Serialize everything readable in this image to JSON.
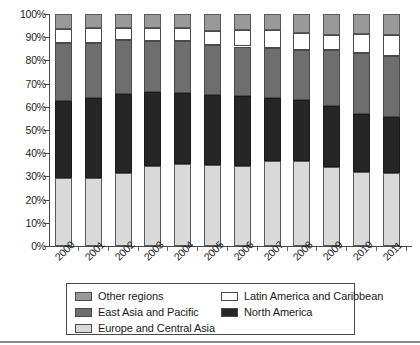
{
  "chart_data": {
    "type": "bar",
    "subtype": "stacked-100-percent",
    "title": "",
    "subtitle": "",
    "xlabel": "",
    "ylabel": "",
    "ylim": [
      0,
      100
    ],
    "yticks": [
      "0%",
      "10%",
      "20%",
      "30%",
      "40%",
      "50%",
      "60%",
      "70%",
      "80%",
      "90%",
      "100%"
    ],
    "ytick_values": [
      0,
      10,
      20,
      30,
      40,
      50,
      60,
      70,
      80,
      90,
      100
    ],
    "grid": false,
    "legend_position": "bottom",
    "categories": [
      "2000",
      "2001",
      "2002",
      "2003",
      "2004",
      "2005",
      "2006",
      "2007",
      "2008",
      "2009",
      "2010",
      "2011"
    ],
    "stack_order_bottom_to_top": [
      "Europe and Central Asia",
      "North America",
      "East Asia and Pacific",
      "Latin America and Caribbean",
      "Other regions"
    ],
    "series": [
      {
        "name": "Europe and Central Asia",
        "color": "#d9d9d9",
        "values": [
          29.5,
          29.5,
          31.5,
          34.5,
          35.5,
          35.0,
          34.5,
          36.5,
          36.5,
          34.0,
          32.0,
          31.5
        ]
      },
      {
        "name": "North America",
        "color": "#262626",
        "values": [
          33.0,
          34.5,
          34.0,
          32.0,
          30.5,
          30.0,
          30.0,
          27.5,
          26.5,
          26.5,
          25.0,
          24.0
        ]
      },
      {
        "name": "East Asia and Pacific",
        "color": "#6e6e6e",
        "values": [
          25.0,
          23.5,
          23.5,
          22.0,
          22.5,
          21.5,
          21.5,
          21.5,
          21.5,
          24.0,
          26.0,
          26.5
        ]
      },
      {
        "name": "Latin America and Caribbean",
        "color": "#ffffff",
        "values": [
          6.0,
          6.5,
          5.0,
          5.5,
          5.5,
          6.0,
          7.0,
          7.5,
          7.5,
          6.5,
          8.5,
          9.0
        ]
      },
      {
        "name": "Other regions",
        "color": "#999999",
        "values": [
          6.5,
          6.0,
          6.0,
          6.0,
          6.0,
          7.5,
          7.0,
          7.0,
          8.0,
          9.0,
          8.5,
          9.0
        ]
      }
    ],
    "cumulative_tops": [
      [
        29.5,
        62.5,
        87.5,
        93.5,
        100
      ],
      [
        29.5,
        64.0,
        87.5,
        94.0,
        100
      ],
      [
        31.5,
        65.5,
        89.0,
        94.0,
        100
      ],
      [
        34.5,
        66.5,
        88.5,
        94.0,
        100
      ],
      [
        35.5,
        66.0,
        88.5,
        94.0,
        100
      ],
      [
        35.0,
        65.0,
        86.5,
        92.5,
        100
      ],
      [
        34.5,
        64.5,
        86.0,
        93.0,
        100
      ],
      [
        36.5,
        64.0,
        85.5,
        93.0,
        100
      ],
      [
        36.5,
        63.0,
        84.5,
        92.0,
        100
      ],
      [
        34.0,
        60.5,
        84.5,
        91.0,
        100
      ],
      [
        32.0,
        57.0,
        83.0,
        91.5,
        100
      ],
      [
        31.5,
        55.5,
        82.0,
        91.0,
        100
      ]
    ]
  },
  "legend": {
    "rows": [
      {
        "a": {
          "label": "Other regions",
          "color": "#999999",
          "icon": "legend-swatch-other-regions"
        },
        "b": {
          "label": "Latin America and Caribbean",
          "color": "#ffffff",
          "icon": "legend-swatch-latin-america-and-caribbean"
        }
      },
      {
        "a": {
          "label": "East Asia and Pacific",
          "color": "#6e6e6e",
          "icon": "legend-swatch-east-asia-and-pacific"
        },
        "b": {
          "label": "North America",
          "color": "#262626",
          "icon": "legend-swatch-north-america"
        }
      },
      {
        "a": {
          "label": "Europe and Central Asia",
          "color": "#d9d9d9",
          "icon": "legend-swatch-europe-and-central-asia"
        },
        "b": null
      }
    ]
  },
  "colors": {
    "other_regions": "#999999",
    "latin_america_and_caribbean": "#ffffff",
    "east_asia_and_pacific": "#6e6e6e",
    "north_america": "#262626",
    "europe_and_central_asia": "#d9d9d9",
    "axis": "#4a4a4a",
    "text": "#1a1a1a",
    "page_rule": "#8a8a8a"
  }
}
